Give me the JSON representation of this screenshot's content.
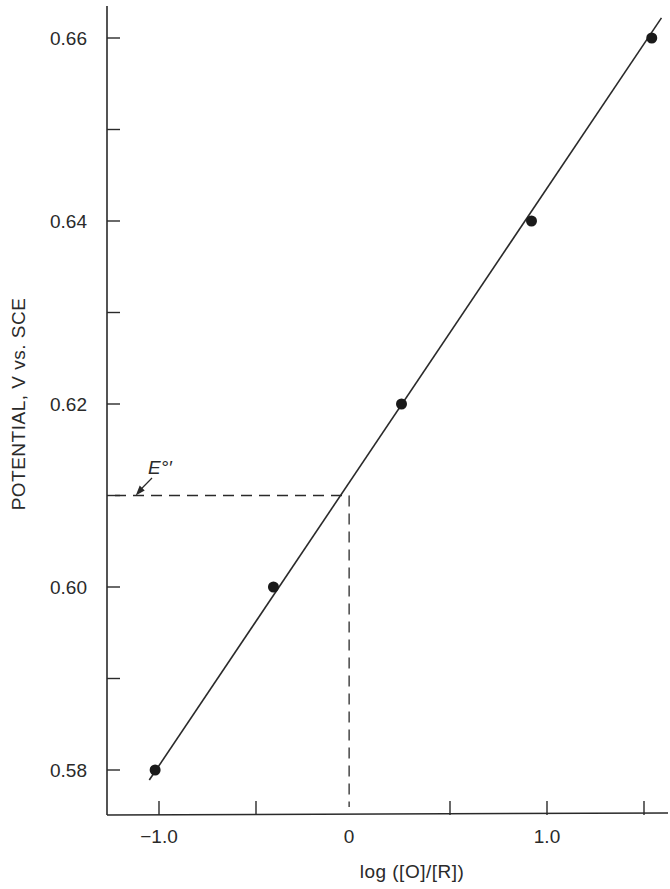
{
  "chart_data": {
    "type": "scatter",
    "title": "",
    "xlabel": "log ([O]/[R])",
    "ylabel": "POTENTIAL, V vs. SCE",
    "xlim": [
      -1.25,
      1.6
    ],
    "ylim": [
      0.57,
      0.665
    ],
    "grid": false,
    "legend": "none",
    "x_ticks": [
      -1.0,
      -0.5,
      0.5,
      1.0,
      1.5
    ],
    "x_tick_labels": [
      {
        "value": -1.0,
        "label": "-1.0"
      },
      {
        "value": 0.0,
        "label": "0"
      },
      {
        "value": 1.0,
        "label": "1.0"
      }
    ],
    "y_ticks": [
      0.58,
      0.59,
      0.6,
      0.61,
      0.62,
      0.63,
      0.64,
      0.65,
      0.66
    ],
    "y_tick_labels": [
      {
        "value": 0.58,
        "label": "0.58"
      },
      {
        "value": 0.6,
        "label": "0.60"
      },
      {
        "value": 0.62,
        "label": "0.62"
      },
      {
        "value": 0.64,
        "label": "0.64"
      },
      {
        "value": 0.66,
        "label": "0.66"
      }
    ],
    "series": [
      {
        "name": "measured",
        "marker": "filled-circle",
        "points": [
          {
            "x": -1.02,
            "y": 0.58
          },
          {
            "x": -0.41,
            "y": 0.6
          },
          {
            "x": 0.25,
            "y": 0.62
          },
          {
            "x": 0.92,
            "y": 0.64
          },
          {
            "x": 1.54,
            "y": 0.66
          }
        ]
      }
    ],
    "fit_line": {
      "x_start": -1.05,
      "y_start": 0.5789,
      "x_end": 1.59,
      "y_end": 0.6622
    },
    "reference_lines": {
      "e0_potential": 0.61,
      "e0_log_ratio": -0.02
    },
    "annotations": [
      {
        "text": "E°′",
        "target": {
          "x": -1.12,
          "y": 0.61
        }
      }
    ]
  }
}
